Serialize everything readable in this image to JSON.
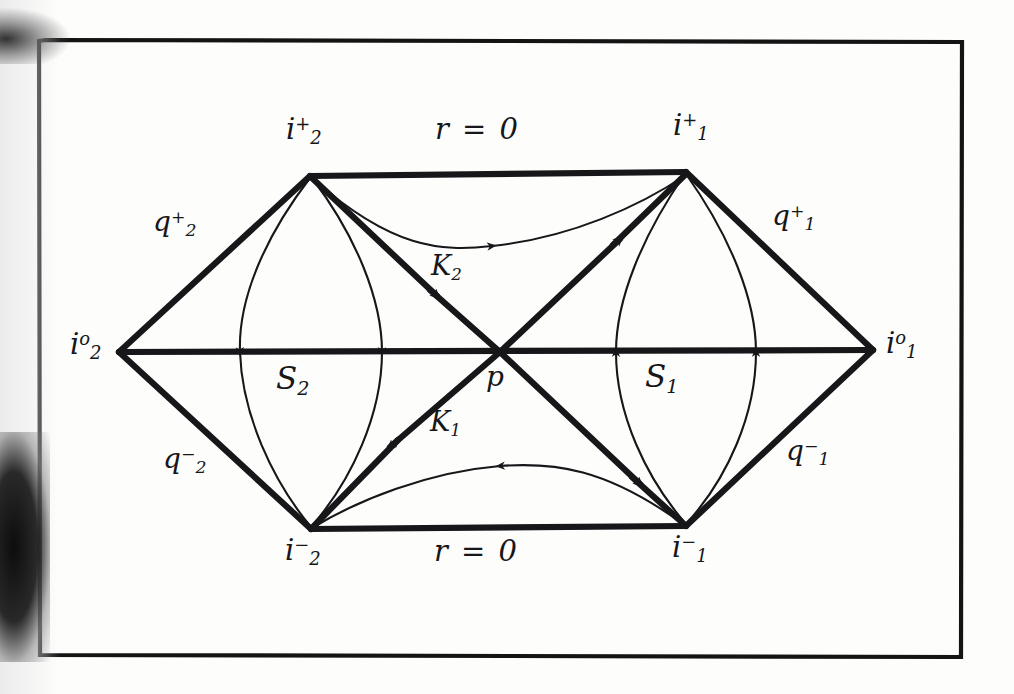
{
  "figure": {
    "kind": "penrose-conformal-diagram",
    "frame": {
      "stroke_color": "#141414"
    },
    "ink_color": "#17171a",
    "labels": {
      "top_null_infinity_2": {
        "base": "i",
        "sup": "+",
        "sub": "2"
      },
      "top_null_infinity_1": {
        "base": "i",
        "sup": "+",
        "sub": "1"
      },
      "spatial_infinity_2": {
        "base": "i",
        "sup": "o",
        "sub": "2"
      },
      "spatial_infinity_1": {
        "base": "i",
        "sup": "o",
        "sub": "1"
      },
      "bottom_null_infinity_2": {
        "base": "i",
        "sup": "−",
        "sub": "2"
      },
      "bottom_null_infinity_1": {
        "base": "i",
        "sup": "−",
        "sub": "1"
      },
      "scri_plus_2": {
        "base": "q",
        "sup": "+",
        "sub": "2"
      },
      "scri_plus_1": {
        "base": "q",
        "sup": "+",
        "sub": "1"
      },
      "scri_minus_2": {
        "base": "q",
        "sup": "−",
        "sub": "2"
      },
      "scri_minus_1": {
        "base": "q",
        "sup": "−",
        "sub": "1"
      },
      "horizon_K2": {
        "base": "K",
        "sup": "",
        "sub": "2"
      },
      "horizon_K1": {
        "base": "K",
        "sup": "",
        "sub": "1"
      },
      "region_S2": {
        "base": "S",
        "sup": "",
        "sub": "2"
      },
      "region_S1": {
        "base": "S",
        "sup": "",
        "sub": "1"
      },
      "center_point": {
        "base": "p",
        "sup": "",
        "sub": ""
      },
      "top_equation": "r = 0",
      "bottom_equation": "r = 0"
    }
  }
}
